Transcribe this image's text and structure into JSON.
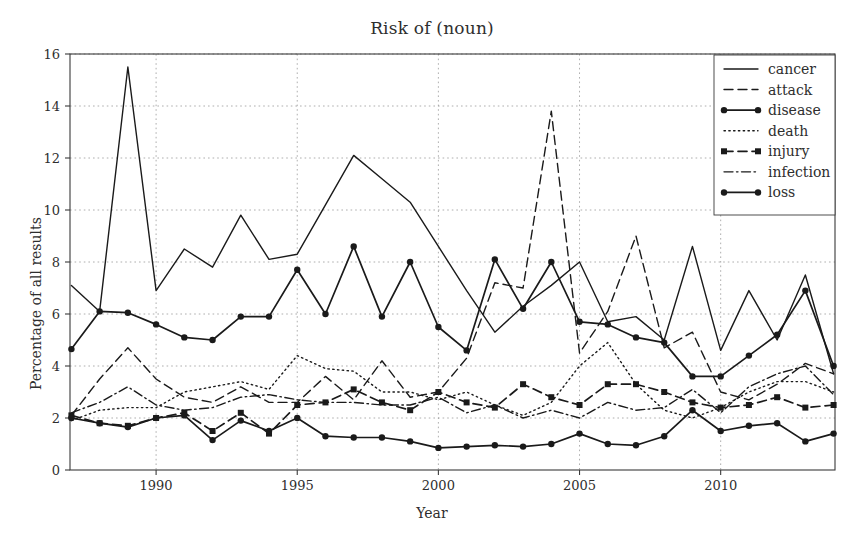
{
  "chart_data": {
    "type": "line",
    "title": "Risk of (noun)",
    "xlabel": "Year",
    "ylabel": "Percentage of all results",
    "xlim": [
      1986.95,
      1987.05
    ],
    "ylim": [
      0,
      16
    ],
    "yticks": [
      0,
      2,
      4,
      6,
      8,
      10,
      12,
      14,
      16
    ],
    "xticks": [
      1990,
      1995,
      2000,
      2005,
      2010
    ],
    "grid": true,
    "legend_position": "top-right",
    "x": [
      1987,
      1988,
      1989,
      1990,
      1991,
      1992,
      1993,
      1994,
      1995,
      1996,
      1997,
      1998,
      1999,
      2000,
      2001,
      2002,
      2003,
      2004,
      2005,
      2006,
      2007,
      2008,
      2009,
      2010,
      2011,
      2012,
      2013,
      2014
    ],
    "series": [
      {
        "name": "cancer",
        "style": "solid",
        "marker": "none",
        "values": [
          7.1,
          6.1,
          15.5,
          6.9,
          8.5,
          7.8,
          9.8,
          8.1,
          8.3,
          10.2,
          12.1,
          11.2,
          10.3,
          8.6,
          6.9,
          5.3,
          6.3,
          7.1,
          8.0,
          5.7,
          5.9,
          5.0,
          8.6,
          4.6,
          6.9,
          5.0,
          7.5,
          3.7
        ]
      },
      {
        "name": "attack",
        "style": "dashed",
        "marker": "none",
        "values": [
          2.1,
          3.5,
          4.7,
          3.5,
          2.8,
          2.6,
          3.2,
          2.6,
          2.6,
          3.6,
          2.7,
          4.2,
          2.8,
          3.0,
          4.3,
          7.2,
          7.0,
          13.8,
          4.5,
          6.1,
          9.0,
          4.7,
          5.3,
          3.0,
          2.7,
          3.3,
          4.1,
          3.7
        ]
      },
      {
        "name": "disease",
        "style": "solid",
        "marker": "circle",
        "values": [
          4.65,
          6.1,
          6.05,
          5.6,
          5.1,
          5.0,
          5.9,
          5.9,
          7.7,
          6.0,
          8.6,
          5.9,
          8.0,
          5.5,
          4.6,
          8.1,
          6.2,
          8.0,
          5.7,
          5.6,
          5.1,
          4.9,
          3.6,
          3.6,
          4.4,
          5.2,
          6.9,
          4.0
        ]
      },
      {
        "name": "death",
        "style": "dotted",
        "marker": "none",
        "values": [
          1.9,
          2.3,
          2.4,
          2.4,
          3.0,
          3.2,
          3.4,
          3.1,
          4.4,
          3.9,
          3.8,
          3.0,
          3.0,
          2.7,
          3.0,
          2.5,
          2.1,
          2.6,
          4.0,
          4.9,
          3.3,
          2.3,
          2.0,
          2.4,
          3.0,
          3.4,
          3.4,
          3.0
        ]
      },
      {
        "name": "injury",
        "style": "dashed",
        "marker": "square",
        "values": [
          2.1,
          1.8,
          1.7,
          2.0,
          2.2,
          1.5,
          2.2,
          1.4,
          2.5,
          2.6,
          3.1,
          2.6,
          2.3,
          3.0,
          2.6,
          2.4,
          3.3,
          2.8,
          2.5,
          3.3,
          3.3,
          3.0,
          2.6,
          2.4,
          2.5,
          2.8,
          2.4,
          2.5
        ]
      },
      {
        "name": "infection",
        "style": "dashdot",
        "marker": "none",
        "values": [
          2.2,
          2.6,
          3.2,
          2.5,
          2.3,
          2.4,
          2.8,
          2.9,
          2.7,
          2.6,
          2.6,
          2.5,
          2.5,
          2.8,
          2.2,
          2.5,
          2.0,
          2.3,
          2.0,
          2.6,
          2.3,
          2.4,
          3.1,
          2.2,
          3.2,
          3.7,
          4.0,
          2.9
        ]
      },
      {
        "name": "loss",
        "style": "solid",
        "marker": "circle",
        "values": [
          2.0,
          1.8,
          1.65,
          2.0,
          2.1,
          1.15,
          1.9,
          1.5,
          2.0,
          1.3,
          1.25,
          1.25,
          1.1,
          0.85,
          0.9,
          0.95,
          0.9,
          1.0,
          1.4,
          1.0,
          0.95,
          1.3,
          2.3,
          1.5,
          1.7,
          1.8,
          1.1,
          1.4
        ]
      }
    ]
  },
  "legend": {
    "items": [
      {
        "label": "cancer"
      },
      {
        "label": "attack"
      },
      {
        "label": "disease"
      },
      {
        "label": "death"
      },
      {
        "label": "injury"
      },
      {
        "label": "infection"
      },
      {
        "label": "loss"
      }
    ]
  },
  "colors": {
    "line": "#1a1a1a",
    "grid": "#9a9a9a",
    "axis": "#3a3a3a",
    "text": "#2e2e2e",
    "background": "#ffffff"
  }
}
